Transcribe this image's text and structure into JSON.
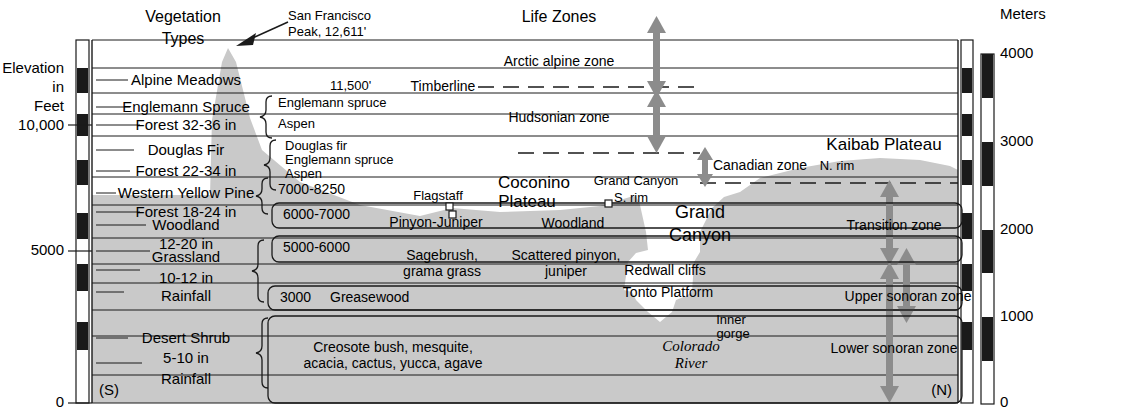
{
  "figure": {
    "title_left_axis": [
      "Elevation",
      "in",
      "Feet"
    ],
    "title_right_axis": "Meters",
    "south_marker": "(S)",
    "north_marker": "(N)"
  },
  "axes": {
    "left": {
      "label_lines": [
        "Elevation",
        "in",
        "Feet"
      ],
      "unit": "feet",
      "ticks": [
        {
          "value": 10000,
          "label": "10,000",
          "y": 125
        },
        {
          "value": 5000,
          "label": "5000",
          "y": 251
        },
        {
          "value": 0,
          "label": "0",
          "y": 403
        }
      ],
      "range": [
        0,
        13000
      ]
    },
    "right": {
      "label": "Meters",
      "unit": "meters",
      "ticks": [
        {
          "value": 4000,
          "label": "4000",
          "y": 54
        },
        {
          "value": 3000,
          "label": "3000",
          "y": 142
        },
        {
          "value": 2000,
          "label": "2000",
          "y": 230
        },
        {
          "value": 1000,
          "label": "1000",
          "y": 317
        },
        {
          "value": 0,
          "label": "0",
          "y": 404
        }
      ],
      "range": [
        0,
        4100
      ]
    }
  },
  "headers": {
    "vegetation_types": [
      "Vegetation",
      "Types"
    ],
    "life_zones": "Life Zones"
  },
  "peak_callout": {
    "name_line1": "San Francisco",
    "name_line2": "Peak, 12,611'"
  },
  "vegetation_types": [
    {
      "name": "alpine-meadows",
      "lines": [
        "Alpine Meadows"
      ],
      "y": 80
    },
    {
      "name": "englemann-spruce-forest",
      "lines": [
        "Englemann Spruce",
        "Forest 32-36 in"
      ],
      "y": 107
    },
    {
      "name": "douglas-fir-forest",
      "lines": [
        "Douglas Fir",
        "Forest 22-34 in"
      ],
      "y": 150
    },
    {
      "name": "western-yellow-pine-forest",
      "lines": [
        "Western Yellow Pine",
        "Forest 18-24 in"
      ],
      "y": 193
    },
    {
      "name": "woodland",
      "lines": [
        "Woodland",
        "12-20 in"
      ],
      "y": 225
    },
    {
      "name": "grassland",
      "lines": [
        "Grassland",
        "10-12 in"
      ],
      "y": 257
    },
    {
      "name": "rainfall-10-12",
      "lines": [
        "Rainfall"
      ],
      "y": 292
    },
    {
      "name": "desert-shrub",
      "lines": [
        "Desert Shrub",
        "5-10 in",
        "Rainfall"
      ],
      "y": 338
    }
  ],
  "elevation_bands": [
    {
      "name": "timberline-elevation",
      "label": "11,500'",
      "x": 330,
      "y": 87
    },
    {
      "name": "band-englemann-spruce",
      "label": "Englemann spruce",
      "x": 278,
      "y": 104
    },
    {
      "name": "band-aspen",
      "label": "Aspen",
      "x": 278,
      "y": 125
    },
    {
      "name": "band-douglas-fir",
      "label": "Douglas fir",
      "x": 285,
      "y": 146
    },
    {
      "name": "band-englemann-spruce-2",
      "label": "Englemann spruce",
      "x": 285,
      "y": 159
    },
    {
      "name": "band-aspen-2",
      "label": "Aspen",
      "x": 285,
      "y": 173
    },
    {
      "name": "band-7000-8250",
      "label": "7000-8250",
      "x": 278,
      "y": 189
    },
    {
      "name": "band-6000-7000",
      "label": "6000-7000",
      "x": 283,
      "y": 214
    },
    {
      "name": "band-5000-6000",
      "label": "5000-6000",
      "x": 283,
      "y": 247
    },
    {
      "name": "band-3000",
      "label": "3000",
      "x": 280,
      "y": 297
    }
  ],
  "feature_labels": [
    {
      "name": "timberline",
      "label": "Timberline",
      "x": 443,
      "y": 87
    },
    {
      "name": "flagstaff",
      "label": "Flagstaff",
      "x": 438,
      "y": 196
    },
    {
      "name": "coconino-plateau-l1",
      "label": "Coconino",
      "x": 534,
      "y": 183
    },
    {
      "name": "coconino-plateau-l2",
      "label": "Plateau",
      "x": 527,
      "y": 201
    },
    {
      "name": "grand-canyon-srim-l1",
      "label": "Grand Canyon",
      "x": 634,
      "y": 181
    },
    {
      "name": "grand-canyon-srim-l2",
      "label": "S. rim",
      "x": 628,
      "y": 198
    },
    {
      "name": "pinyon-juniper",
      "label": "Pinyon-Juniper",
      "x": 436,
      "y": 222
    },
    {
      "name": "woodland-mid",
      "label": "Woodland",
      "x": 573,
      "y": 224
    },
    {
      "name": "sagebrush-l1",
      "label": "Sagebrush,",
      "x": 442,
      "y": 255
    },
    {
      "name": "sagebrush-l2",
      "label": "grama grass",
      "x": 442,
      "y": 270
    },
    {
      "name": "scattered-pinyon-l1",
      "label": "Scattered pinyon,",
      "x": 566,
      "y": 255
    },
    {
      "name": "scattered-pinyon-l2",
      "label": "juniper",
      "x": 566,
      "y": 270
    },
    {
      "name": "greasewood",
      "label": "Greasewood",
      "x": 330,
      "y": 296
    },
    {
      "name": "creosote-l1",
      "label": "Creosote bush, mesquite,",
      "x": 393,
      "y": 347
    },
    {
      "name": "creosote-l2",
      "label": "acacia, cactus, yucca, agave",
      "x": 393,
      "y": 363
    },
    {
      "name": "grand-canyon-big-l1",
      "label": "Grand",
      "x": 694,
      "y": 213
    },
    {
      "name": "grand-canyon-big-l2",
      "label": "Canyon",
      "x": 694,
      "y": 235
    },
    {
      "name": "redwall-cliffs",
      "label": "Redwall cliffs",
      "x": 665,
      "y": 270
    },
    {
      "name": "tonto-platform",
      "label": "Tonto Platform",
      "x": 668,
      "y": 292
    },
    {
      "name": "inner-gorge-l1",
      "label": "Inner",
      "x": 731,
      "y": 320
    },
    {
      "name": "inner-gorge-l2",
      "label": "gorge",
      "x": 733,
      "y": 334
    },
    {
      "name": "kaibab-plateau",
      "label": "Kaibab Plateau",
      "x": 884,
      "y": 146
    },
    {
      "name": "north-rim",
      "label": "N. rim",
      "x": 837,
      "y": 167
    }
  ],
  "river": {
    "line1": "Colorado",
    "line2": "River",
    "x": 691,
    "y1": 347,
    "y2": 363
  },
  "life_zones": [
    {
      "name": "arctic-alpine-zone",
      "label": "Arctic alpine zone",
      "x": 559,
      "y": 62
    },
    {
      "name": "hudsonian-zone",
      "label": "Hudsonian zone",
      "x": 559,
      "y": 118
    },
    {
      "name": "canadian-zone",
      "label": "Canadian zone",
      "x": 737,
      "y": 165
    },
    {
      "name": "transition-zone",
      "label": "Transition zone",
      "x": 894,
      "y": 225
    },
    {
      "name": "upper-sonoran-zone",
      "label": "Upper sonoran zone",
      "x": 908,
      "y": 296
    },
    {
      "name": "lower-sonoran-zone",
      "label": "Lower sonoran zone",
      "x": 894,
      "y": 348
    }
  ],
  "colors": {
    "terrain_fill": "#c9c9c9",
    "line": "#1a1a1a",
    "arrow": "#8c8c8c",
    "background": "#ffffff"
  },
  "grid_lines_y": [
    40,
    68,
    93,
    114,
    136,
    177,
    205,
    238,
    264,
    283,
    310,
    336,
    375,
    403
  ]
}
